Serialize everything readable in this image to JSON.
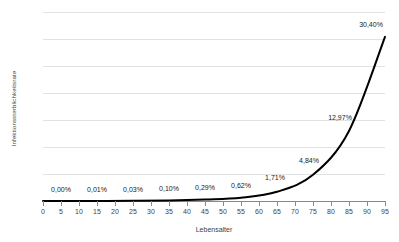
{
  "chart_data": {
    "type": "line",
    "title": "",
    "xlabel": "Lebensalter",
    "ylabel": "Infektionssterblichkeitsrate",
    "xlim": [
      0,
      95
    ],
    "ylim": [
      0,
      35
    ],
    "grid": true,
    "legend": false,
    "x": [
      5,
      15,
      25,
      35,
      45,
      55,
      65,
      75,
      85,
      95
    ],
    "values": [
      0.0,
      0.01,
      0.03,
      0.1,
      0.29,
      0.62,
      1.71,
      4.84,
      12.97,
      30.4
    ],
    "point_labels": [
      "0,00%",
      "0,01%",
      "0,03%",
      "0,10%",
      "0,29%",
      "0,62%",
      "1,71%",
      "4,84%",
      "12,97%",
      "30,40%"
    ],
    "y_ticks": [
      0,
      5,
      10,
      15,
      20,
      25,
      30,
      35
    ],
    "y_tick_labels": [
      "0%",
      "5%",
      "10%",
      "15%",
      "20%",
      "25%",
      "30%",
      "35%"
    ],
    "x_ticks": [
      0,
      5,
      10,
      15,
      20,
      25,
      30,
      35,
      40,
      45,
      50,
      55,
      60,
      65,
      70,
      75,
      80,
      85,
      90,
      95
    ],
    "x_tick_labels": [
      "0",
      "5",
      "10",
      "15",
      "20",
      "25",
      "30",
      "35",
      "40",
      "45",
      "50",
      "55",
      "60",
      "65",
      "70",
      "75",
      "80",
      "85",
      "90",
      "95"
    ],
    "series_color": "#000000",
    "grid_color": "#e2e2e2",
    "axis_color": "#8a8a8a",
    "background": "#ffffff"
  }
}
